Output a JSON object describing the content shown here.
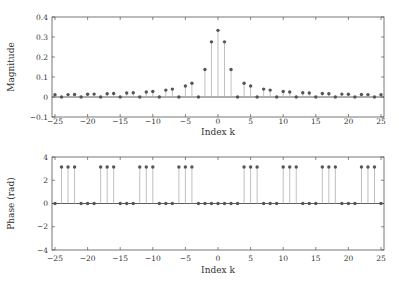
{
  "figure": {
    "background": "#ffffff",
    "stem_color": "#b0b0b0",
    "marker_color": "#555555",
    "axis_color": "#555555",
    "baseline_color": "#333333"
  },
  "chart_data": [
    {
      "type": "stem",
      "title": "",
      "xlabel": "Index k",
      "ylabel": "Magnitude",
      "xlim": [
        -25,
        25
      ],
      "ylim": [
        -0.1,
        0.4
      ],
      "xticks": [
        -25,
        -20,
        -15,
        -10,
        -5,
        0,
        5,
        10,
        15,
        20,
        25
      ],
      "yticks": [
        -0.1,
        0,
        0.1,
        0.2,
        0.3,
        0.4
      ],
      "ytick_labels": [
        "-0.1",
        "0",
        "0.1",
        "0.2",
        "0.3",
        "0.4"
      ],
      "grid": false,
      "x": [
        -25,
        -24,
        -23,
        -22,
        -21,
        -20,
        -19,
        -18,
        -17,
        -16,
        -15,
        -14,
        -13,
        -12,
        -11,
        -10,
        -9,
        -8,
        -7,
        -6,
        -5,
        -4,
        -3,
        -2,
        -1,
        0,
        1,
        2,
        3,
        4,
        5,
        6,
        7,
        8,
        9,
        10,
        11,
        12,
        13,
        14,
        15,
        16,
        17,
        18,
        19,
        20,
        21,
        22,
        23,
        24,
        25
      ],
      "values": [
        0.011,
        0.0,
        0.012,
        0.0125,
        0.0,
        0.0138,
        0.0145,
        0.0,
        0.0162,
        0.0172,
        0.0,
        0.0197,
        0.0212,
        0.0,
        0.0251,
        0.0276,
        0.0,
        0.0345,
        0.0394,
        0.0,
        0.0551,
        0.0689,
        0.0,
        0.1378,
        0.2757,
        0.3333,
        0.2757,
        0.1378,
        0.0,
        0.0689,
        0.0551,
        0.0,
        0.0394,
        0.0345,
        0.0,
        0.0276,
        0.0251,
        0.0,
        0.0212,
        0.0197,
        0.0,
        0.0172,
        0.0162,
        0.0,
        0.0145,
        0.0138,
        0.0,
        0.0125,
        0.012,
        0.0,
        0.011
      ]
    },
    {
      "type": "stem",
      "title": "",
      "xlabel": "Index k",
      "ylabel": "Phase (rad)",
      "xlim": [
        -25,
        25
      ],
      "ylim": [
        -4,
        4
      ],
      "xticks": [
        -25,
        -20,
        -15,
        -10,
        -5,
        0,
        5,
        10,
        15,
        20,
        25
      ],
      "yticks": [
        -4,
        -2,
        0,
        2,
        4
      ],
      "ytick_labels": [
        "-4",
        "-2",
        "0",
        "2",
        "4"
      ],
      "grid": false,
      "x": [
        -25,
        -24,
        -23,
        -22,
        -21,
        -20,
        -19,
        -18,
        -17,
        -16,
        -15,
        -14,
        -13,
        -12,
        -11,
        -10,
        -9,
        -8,
        -7,
        -6,
        -5,
        -4,
        -3,
        -2,
        -1,
        0,
        1,
        2,
        3,
        4,
        5,
        6,
        7,
        8,
        9,
        10,
        11,
        12,
        13,
        14,
        15,
        16,
        17,
        18,
        19,
        20,
        21,
        22,
        23,
        24,
        25
      ],
      "values": [
        0,
        3.1416,
        3.1416,
        3.1416,
        0,
        0,
        0,
        3.1416,
        3.1416,
        3.1416,
        0,
        0,
        0,
        3.1416,
        3.1416,
        3.1416,
        0,
        0,
        0,
        3.1416,
        3.1416,
        3.1416,
        0,
        0,
        0,
        0,
        0,
        0,
        0,
        3.1416,
        3.1416,
        3.1416,
        0,
        0,
        0,
        3.1416,
        3.1416,
        3.1416,
        0,
        0,
        0,
        3.1416,
        3.1416,
        3.1416,
        0,
        0,
        0,
        3.1416,
        3.1416,
        3.1416,
        0
      ]
    }
  ]
}
